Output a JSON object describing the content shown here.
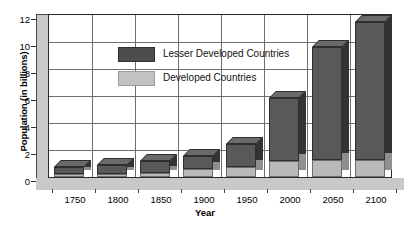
{
  "chart_data": {
    "type": "bar",
    "subtype": "stacked-3d-column",
    "title": "",
    "xlabel": "Year",
    "ylabel": "Population (in billions)",
    "categories": [
      "1750",
      "1800",
      "1850",
      "1900",
      "1950",
      "2000",
      "2050",
      "2100"
    ],
    "series": [
      {
        "name": "Developed Countries",
        "color": "#bdbdbd",
        "values": [
          0.2,
          0.2,
          0.3,
          0.6,
          0.8,
          1.2,
          1.3,
          1.3
        ]
      },
      {
        "name": "Lesser Developed Countries",
        "color": "#4d4d4d",
        "values": [
          0.6,
          0.7,
          0.9,
          1.0,
          1.7,
          4.9,
          8.7,
          10.6
        ]
      }
    ],
    "totals": [
      0.8,
      0.9,
      1.2,
      1.6,
      2.5,
      6.1,
      10.0,
      11.9
    ],
    "yticks": [
      0,
      2,
      4,
      6,
      8,
      10,
      12
    ],
    "ylim": [
      0,
      12.6
    ],
    "grid": "both",
    "legend_position": "inside-top-left",
    "legend": [
      "Lesser Developed Countries",
      "Developed Countries"
    ]
  },
  "axes": {
    "y_title": "Population (in billions)",
    "x_title": "Year",
    "y_ticks": [
      "12",
      "10",
      "8",
      "6",
      "4",
      "2",
      "0"
    ],
    "x_ticks": [
      "1750",
      "1800",
      "1850",
      "1900",
      "1950",
      "2000",
      "2050",
      "2100"
    ]
  },
  "legend": {
    "items": [
      {
        "label": "Lesser Developed Countries",
        "color": "#4d4d4d"
      },
      {
        "label": "Developed Countries",
        "color": "#c2c2c2"
      }
    ]
  },
  "colors": {
    "lesser_developed": "#4d4d4d",
    "developed": "#bdbdbd",
    "plot_background": "#ffffff",
    "wall": "#c9c9c9",
    "gridline": "#6e6e6e",
    "border": "#2b2b2b"
  }
}
